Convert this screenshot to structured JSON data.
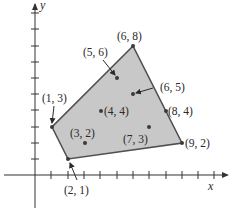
{
  "figure": {
    "type": "feasible-region-plot",
    "axes": {
      "x_label": "x",
      "y_label": "y",
      "x_ticks": [
        1,
        2,
        3,
        4,
        5,
        6,
        7,
        8,
        9,
        10,
        11
      ],
      "y_ticks": [
        1,
        2,
        3,
        4,
        5,
        6,
        7,
        8,
        9,
        10
      ]
    },
    "colors": {
      "region_fill": "#c8c8c8",
      "region_edge": "#505050",
      "point": "#3a3a3a",
      "axis": "#333333"
    },
    "polygon_vertices": [
      {
        "x": 6,
        "y": 8,
        "label": "(6, 8)"
      },
      {
        "x": 9,
        "y": 2,
        "label": "(9, 2)"
      },
      {
        "x": 2,
        "y": 1,
        "label": "(2, 1)"
      },
      {
        "x": 1,
        "y": 3,
        "label": "(1, 3)"
      }
    ],
    "points": [
      {
        "x": 5,
        "y": 6,
        "label": "(5, 6)"
      },
      {
        "x": 6,
        "y": 5,
        "label": "(6, 5)"
      },
      {
        "x": 4,
        "y": 4,
        "label": "(4, 4)"
      },
      {
        "x": 8,
        "y": 4,
        "label": "(8, 4)"
      },
      {
        "x": 3,
        "y": 2,
        "label": "(3, 2)"
      },
      {
        "x": 7,
        "y": 3,
        "label": "(7, 3)"
      }
    ]
  },
  "labels": {
    "v_6_8": "(6, 8)",
    "v_1_3": "(1, 3)",
    "v_2_1": "(2, 1)",
    "v_9_2": "(9, 2)",
    "p_5_6": "(5, 6)",
    "p_6_5": "(6, 5)",
    "p_4_4": "(4, 4)",
    "p_8_4": "(8, 4)",
    "p_3_2": "(3, 2)",
    "p_7_3": "(7, 3)",
    "x_axis": "x",
    "y_axis": "y"
  }
}
